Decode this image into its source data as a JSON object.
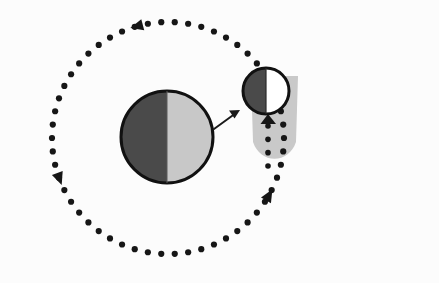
{
  "canvas": {
    "width": 439,
    "height": 283,
    "background": "#fcfcfc",
    "title": "Orbital phase diagram of a primary body and its satellite"
  },
  "colors": {
    "background": "#fcfcfc",
    "dark_hemisphere": "#4a4a4a",
    "light_hemisphere": "#c8c8c8",
    "lit_hemisphere_white": "#ffffff",
    "outline": "#111111",
    "shadow_cone": "#c9c9c9",
    "orbit_marker": "#161616",
    "arrow_stroke": "#1a1a1a"
  },
  "primary_body": {
    "name": "primary-body",
    "label": "Primary body",
    "center_x": 167,
    "center_y": 137,
    "radius": 46,
    "outline_width": 3,
    "dark_side": "left",
    "dark_color": "#4a4a4a",
    "light_color": "#c8c8c8"
  },
  "satellite_body": {
    "name": "satellite-body",
    "label": "Satellite body",
    "center_x": 266,
    "center_y": 91,
    "radius": 23,
    "outline_width": 3,
    "dark_side": "left",
    "dark_color": "#4a4a4a",
    "light_color": "#ffffff"
  },
  "shadow_cone": {
    "name": "shadow-cone",
    "label": "Shadow cone",
    "color": "#c9c9c9",
    "top_y": 76,
    "bottom_y": 168,
    "left_x": 249,
    "right_x": 300,
    "corner_radius": 26
  },
  "pointer_arrow": {
    "name": "pointer-arrow",
    "label": "Magnification pointer",
    "from_x": 214,
    "from_y": 129,
    "to_x": 239,
    "to_y": 111,
    "stroke_width": 2,
    "head_size": 7
  },
  "outer_orbit": {
    "name": "outer-orbit-path",
    "label": "Outer orbital path",
    "center_x": 168,
    "center_y": 138,
    "radius": 116,
    "marker_count": 54,
    "marker_radius": 3.1,
    "direction": "counterclockwise",
    "direction_label": "Counterclockwise",
    "arrow_markers": [
      {
        "name": "orbit-arrow-top",
        "angle_deg": 255,
        "size": 11
      },
      {
        "name": "orbit-arrow-left",
        "angle_deg": 160,
        "size": 11
      },
      {
        "name": "orbit-arrow-bottom",
        "angle_deg": 30,
        "size": 11
      }
    ]
  },
  "inner_orbit": {
    "name": "inner-orbit-path",
    "label": "Satellite inner orbital path",
    "x": 268,
    "top_y": 126,
    "bottom_y": 166,
    "marker_count": 4,
    "marker_radius": 2.8,
    "direction": "upward",
    "direction_label": "Upward",
    "arrow": {
      "name": "inner-orbit-arrow",
      "x": 268,
      "y": 121,
      "size": 9
    }
  },
  "legend": {
    "dark_side_label": "Night side",
    "light_side_label": "Day side",
    "shadow_label": "Umbra"
  }
}
